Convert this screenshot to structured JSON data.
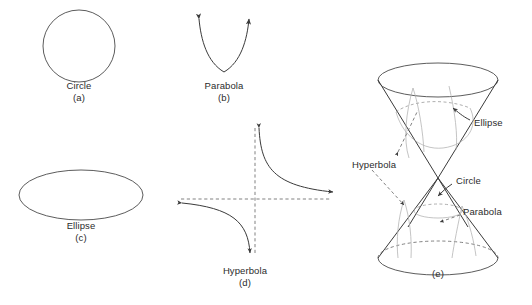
{
  "figure": {
    "title_present": false,
    "background_color": "#ffffff",
    "line_color": "#4a4a4a",
    "text_color": "#2b2b2b",
    "panels": [
      {
        "id": "a",
        "shape_name": "circle",
        "label": "Circle",
        "sublabel": "(a)",
        "label_x": 79,
        "label_y": 86,
        "sublabel_x": 79,
        "sublabel_y": 98
      },
      {
        "id": "b",
        "shape_name": "parabola",
        "label": "Parabola",
        "sublabel": "(b)",
        "label_x": 224,
        "label_y": 86,
        "sublabel_x": 224,
        "sublabel_y": 98
      },
      {
        "id": "c",
        "shape_name": "ellipse",
        "label": "Ellipse",
        "sublabel": "(c)",
        "label_x": 81,
        "label_y": 226,
        "sublabel_x": 81,
        "sublabel_y": 238
      },
      {
        "id": "d",
        "shape_name": "hyperbola",
        "label": "Hyperbola",
        "sublabel": "(d)",
        "label_x": 245,
        "label_y": 271,
        "sublabel_x": 245,
        "sublabel_y": 283
      },
      {
        "id": "e",
        "shape_name": "double-cone-conic-sections",
        "label": "",
        "sublabel": "(e)",
        "sublabel_x": 438,
        "sublabel_y": 274
      }
    ],
    "cone_callouts": [
      {
        "name": "ellipse-callout",
        "label": "Ellipse",
        "x": 474,
        "y": 123
      },
      {
        "name": "hyperbola-callout",
        "label": "Hyperbola",
        "x": 352,
        "y": 165
      },
      {
        "name": "circle-callout",
        "label": "Circle",
        "x": 456,
        "y": 181
      },
      {
        "name": "parabola-callout",
        "label": "Parabola",
        "x": 463,
        "y": 212
      }
    ]
  }
}
